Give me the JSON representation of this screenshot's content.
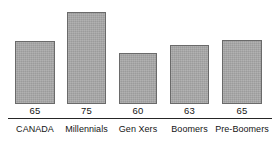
{
  "chart_data": {
    "type": "bar",
    "title": "",
    "subtitle": "",
    "xlabel": "",
    "ylabel": "",
    "grid": false,
    "legend": false,
    "categories": [
      "CANADA",
      "Millennials",
      "Gen Xers",
      "Boomers",
      "Pre-Boomers"
    ],
    "values": [
      65,
      75,
      60,
      63,
      65
    ],
    "value_labels": [
      "65",
      "75",
      "60",
      "63",
      "65"
    ],
    "ylim": [
      0,
      78
    ],
    "series": [
      {
        "name": "",
        "values": [
          65,
          75,
          60,
          63,
          65
        ]
      }
    ],
    "bars": [
      {
        "category": "CANADA",
        "value": 65,
        "label": "65",
        "left": 15,
        "width": 40,
        "top": 40
      },
      {
        "category": "Millennials",
        "value": 75,
        "label": "75",
        "left": 67,
        "width": 39,
        "top": 11
      },
      {
        "category": "Gen Xers",
        "value": 60,
        "label": "60",
        "left": 119,
        "width": 38,
        "top": 52
      },
      {
        "category": "Boomers",
        "value": 63,
        "label": "63",
        "left": 170,
        "width": 39,
        "top": 44
      },
      {
        "category": "Pre-Boomers",
        "value": 65,
        "label": "65",
        "left": 222,
        "width": 40,
        "top": 39
      }
    ],
    "colors": {
      "background": "#ffffff",
      "bar_fill": "#a9a9a9",
      "bar_border": "#6a6a6a",
      "axis_line": "#262626",
      "text": "#141414"
    }
  }
}
